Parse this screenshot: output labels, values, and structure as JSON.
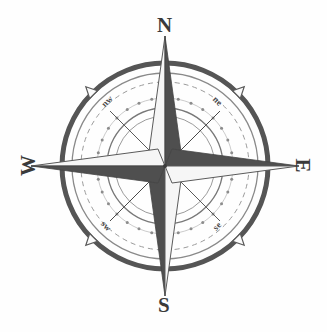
{
  "figure": {
    "name": "compass-rose",
    "background_color": "#fefefe",
    "width": 327,
    "height": 332,
    "center_x": 165,
    "center_y": 166
  },
  "palette": {
    "dark": "#4a4a4a",
    "mid": "#6e6e6e",
    "light": "#f2f2f2",
    "outline": "#555555",
    "ring_dark": "#555555",
    "ring_light": "#8c8c8c",
    "text": "#3a3a3a"
  },
  "cardinal_points": [
    {
      "id": "north",
      "label": "N",
      "bearing_deg": 0,
      "rotation_deg": 0
    },
    {
      "id": "east",
      "label": "E",
      "bearing_deg": 90,
      "rotation_deg": 90
    },
    {
      "id": "south",
      "label": "S",
      "bearing_deg": 180,
      "rotation_deg": 0
    },
    {
      "id": "west",
      "label": "W",
      "bearing_deg": 270,
      "rotation_deg": -90
    }
  ],
  "ordinal_points": [
    {
      "id": "northwest",
      "label": "nw",
      "bearing_deg": 315,
      "rotation_deg": -45
    },
    {
      "id": "northeast",
      "label": "ne",
      "bearing_deg": 45,
      "rotation_deg": 45
    },
    {
      "id": "southwest",
      "label": "sw",
      "bearing_deg": 225,
      "rotation_deg": 45
    },
    {
      "id": "southeast",
      "label": "se",
      "bearing_deg": 135,
      "rotation_deg": -45
    }
  ],
  "rings": [
    {
      "id": "outer-heavy-ring",
      "radius": 103,
      "stroke_width": 5,
      "color": "#555555",
      "style": "solid"
    },
    {
      "id": "outer-thin-ring",
      "radius": 93,
      "stroke_width": 1.2,
      "color": "#888888",
      "style": "solid"
    },
    {
      "id": "dashed-ring",
      "radius": 84,
      "stroke_width": 1,
      "color": "#999999",
      "style": "dashed"
    },
    {
      "id": "dotted-bead-ring",
      "radius": 68,
      "stroke_width": 1,
      "color": "#8c8c8c",
      "style": "beads",
      "bead_count": 32
    },
    {
      "id": "inner-thin-ring",
      "radius": 58,
      "stroke_width": 1.2,
      "color": "#777777",
      "style": "solid"
    },
    {
      "id": "innermost-ring",
      "radius": 50,
      "stroke_width": 1,
      "color": "#999999",
      "style": "solid"
    }
  ],
  "star": {
    "point_count": 8,
    "cardinal_ray_length": 150,
    "ordinal_ray_length": 78,
    "ray_half_width": 17,
    "shading": "each ray split along its axis: one half light, one half dark"
  },
  "fleur_markers": {
    "count": 4,
    "bearings_deg": [
      45,
      135,
      225,
      315
    ],
    "radius": 103,
    "shape": "outward triangle"
  }
}
